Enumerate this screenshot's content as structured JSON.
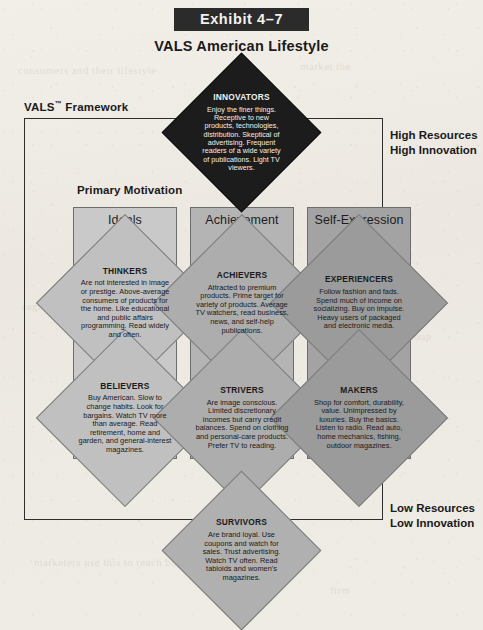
{
  "header": {
    "exhibit_tag": "Exhibit 4–7",
    "title": "VALS American Lifestyle"
  },
  "framework": {
    "label": "VALS",
    "label_sup": "™",
    "label_rest": "Framework",
    "primary_motivation": "Primary Motivation",
    "high_corner_line1": "High Resources",
    "high_corner_line2": "High Innovation",
    "low_corner_line1": "Low Resources",
    "low_corner_line2": "Low Innovation"
  },
  "columns": [
    {
      "key": "ideals",
      "label": "Ideals",
      "color": "#c9c9c9"
    },
    {
      "key": "achievement",
      "label": "Achievement",
      "color": "#b4b4b4"
    },
    {
      "key": "selfexpression",
      "label": "Self-Expression",
      "color": "#a3a3a3"
    }
  ],
  "groups": {
    "innovators": {
      "name": "INNOVATORS",
      "body": "Enjoy the finer things. Receptive to new products, technologies, distribution. Skeptical of advertising. Frequent readers of a wide variety of publications. Light TV viewers."
    },
    "thinkers": {
      "name": "THINKERS",
      "body": "Are not interested in image or prestige. Above-average consumers of products for the home. Like educational and public affairs programming. Read widely and often."
    },
    "achievers": {
      "name": "ACHIEVERS",
      "body": "Attracted to premium products. Prime target for variety of products. Average TV watchers, read business, news, and self-help publications."
    },
    "experiencers": {
      "name": "EXPERIENCERS",
      "body": "Follow fashion and fads. Spend much of income on socializing. Buy on impulse. Heavy users of packaged and electronic media."
    },
    "believers": {
      "name": "BELIEVERS",
      "body": "Buy American. Slow to change habits. Look for bargains. Watch TV more than average. Read retirement, home and garden, and general-interest magazines."
    },
    "strivers": {
      "name": "STRIVERS",
      "body": "Are image conscious. Limited discretionary incomes but carry credit balances. Spend on clothing and personal-care products. Prefer TV to reading."
    },
    "makers": {
      "name": "MAKERS",
      "body": "Shop for comfort, durability, value. Unimpressed by luxuries. Buy the basics. Listen to radio. Read auto, home mechanics, fishing, outdoor magazines."
    },
    "survivors": {
      "name": "SURVIVORS",
      "body": "Are brand loyal. Use coupons and watch for sales. Trust advertising. Watch TV often. Read tabloids and women's magazines."
    }
  }
}
